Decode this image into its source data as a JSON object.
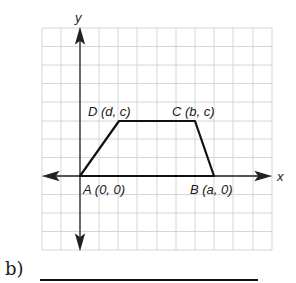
{
  "diagram": {
    "axis_labels": {
      "x": "x",
      "y": "y"
    },
    "vertices": [
      {
        "name": "A",
        "label": "A (0, 0)",
        "px": [
          80,
          176
        ]
      },
      {
        "name": "B",
        "label": "B (a, 0)",
        "px": [
          214,
          176
        ]
      },
      {
        "name": "C",
        "label": "C (b, c)",
        "px": [
          195,
          121
        ]
      },
      {
        "name": "D",
        "label": "D (d, c)",
        "px": [
          119,
          121
        ]
      }
    ],
    "shape": "trapezoid",
    "colors": {
      "grid": "#d4d4d4",
      "axis": "#222222",
      "shape": "#111111"
    }
  },
  "question": {
    "part_label": "b)"
  }
}
